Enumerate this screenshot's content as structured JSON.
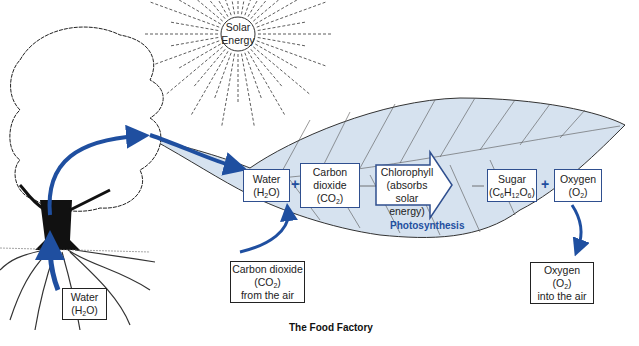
{
  "title": "The Food Factory",
  "sun": {
    "line1": "Solar",
    "line2": "Energy"
  },
  "process_label": "Photosynthesis",
  "plus_sign": "+",
  "leaf_boxes": {
    "water": {
      "line1": "Water",
      "formula_pre": "(H",
      "formula_sub": "2",
      "formula_post": "O)"
    },
    "carbon_dioxide": {
      "line1": "Carbon",
      "line2": "dioxide",
      "formula_pre": "(CO",
      "formula_sub": "2",
      "formula_post": ")"
    },
    "chlorophyll": {
      "line1": "Chlorophyll",
      "line2": "(absorbs",
      "line3": "solar energy)"
    },
    "sugar": {
      "line1": "Sugar",
      "f1": "(C",
      "s1": "6",
      "f2": "H",
      "s2": "12",
      "f3": "O",
      "s3": "6",
      "f4": ")"
    },
    "oxygen": {
      "line1": "Oxygen",
      "formula_pre": "(O",
      "formula_sub": "2",
      "formula_post": ")"
    }
  },
  "external_boxes": {
    "root_water": {
      "line1": "Water",
      "formula_pre": "(H",
      "formula_sub": "2",
      "formula_post": "O)"
    },
    "co2_air": {
      "line1": "Carbon dioxide",
      "formula_pre": "(CO",
      "formula_sub": "2",
      "formula_post": ")",
      "line3": "from the air"
    },
    "o2_air": {
      "line1": "Oxygen",
      "formula_pre": "(O",
      "formula_sub": "2",
      "formula_post": ")",
      "line3": "into the air"
    }
  },
  "colors": {
    "arrow_blue": "#1f4fa0",
    "leaf_fill": "#d6e2ef",
    "box_border": "#2f4f8f"
  }
}
